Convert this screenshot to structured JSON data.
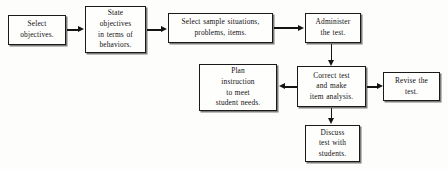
{
  "diagram": {
    "background_color": "#fdfdfb",
    "line_color": "#141414",
    "box_fill": "#fefefd",
    "box_border": "#1a1a1a",
    "nodes": [
      {
        "id": "select-objectives",
        "text": "Select\nobjectives.",
        "lines": [
          "Select",
          "objectives."
        ],
        "x": 8,
        "y": 15,
        "w": 58,
        "h": 30
      },
      {
        "id": "state-objectives",
        "text": "State objectives in terms of behaviors.",
        "lines": [
          "State",
          "objectives",
          "in terms of",
          "behaviors."
        ],
        "x": 85,
        "y": 6,
        "w": 61,
        "h": 47
      },
      {
        "id": "select-sample-situations",
        "text": "Select sample situations, problems, items.",
        "lines": [
          "Select sample situations,",
          "problems, items."
        ],
        "x": 168,
        "y": 13,
        "w": 105,
        "h": 30
      },
      {
        "id": "administer-test",
        "text": "Administer the test.",
        "lines": [
          "Administer",
          "the test."
        ],
        "x": 305,
        "y": 13,
        "w": 56,
        "h": 30
      },
      {
        "id": "plan-instruction",
        "text": "Plan instruction to meet student needs.",
        "lines": [
          "Plan",
          "instruction",
          "to meet",
          "student needs."
        ],
        "x": 199,
        "y": 64,
        "w": 78,
        "h": 47
      },
      {
        "id": "correct-test",
        "text": "Correct test and make item analysis.",
        "lines": [
          "Correct test",
          "and make",
          "item analysis."
        ],
        "x": 297,
        "y": 66,
        "w": 69,
        "h": 41
      },
      {
        "id": "revise-test",
        "text": "Revise the test.",
        "lines": [
          "Revise the",
          "test."
        ],
        "x": 383,
        "y": 72,
        "w": 57,
        "h": 29
      },
      {
        "id": "discuss-test",
        "text": "Discuss test with students.",
        "lines": [
          "Discuss",
          "test with",
          "students."
        ],
        "x": 305,
        "y": 125,
        "w": 55,
        "h": 37
      }
    ],
    "connectors": [
      {
        "id": "select-objectives-to-state-objectives",
        "from": "select-objectives",
        "to": "state-objectives",
        "direction": "right"
      },
      {
        "id": "state-objectives-to-select-sample",
        "from": "state-objectives",
        "to": "select-sample-situations",
        "direction": "right"
      },
      {
        "id": "select-sample-to-administer",
        "from": "select-sample-situations",
        "to": "administer-test",
        "direction": "right"
      },
      {
        "id": "administer-to-correct",
        "from": "administer-test",
        "to": "correct-test",
        "direction": "down"
      },
      {
        "id": "correct-to-plan",
        "from": "correct-test",
        "to": "plan-instruction",
        "direction": "left"
      },
      {
        "id": "correct-to-revise",
        "from": "correct-test",
        "to": "revise-test",
        "direction": "right"
      },
      {
        "id": "correct-to-discuss",
        "from": "correct-test",
        "to": "discuss-test",
        "direction": "down"
      }
    ]
  }
}
